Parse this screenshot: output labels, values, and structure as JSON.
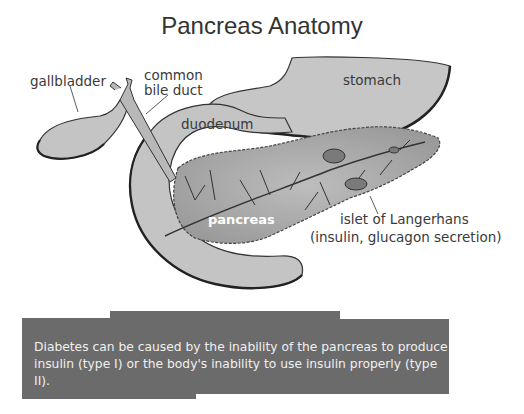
{
  "title": "Pancreas Anatomy",
  "labels": {
    "gallbladder": "gallbladder",
    "common_bile_duct_line1": "common",
    "common_bile_duct_line2": "bile duct",
    "stomach": "stomach",
    "duodenum": "duodenum",
    "pancreas": "pancreas",
    "islet_line1": "islet of Langerhans",
    "islet_line2": "(insulin, glucagon secretion)"
  },
  "caption": {
    "text": "Diabetes can be caused by the inability of the pancreas to produce insulin (type I) or the body's inability to use insulin properly (type II)."
  },
  "colors": {
    "organ_fill": "#c8c8c8",
    "outline": "#333333",
    "caption_bg": "#6b6b6b",
    "caption_text": "#f0f0f0"
  }
}
